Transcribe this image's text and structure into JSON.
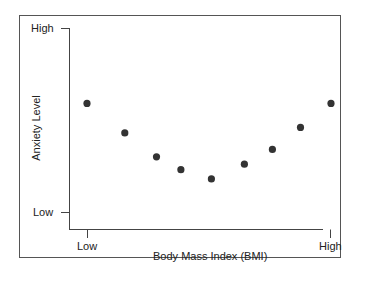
{
  "chart_data": {
    "type": "scatter",
    "title": "",
    "xlabel": "Body Mass Index (BMI)",
    "ylabel": "Anxiety Level",
    "x_tick_labels": [
      "Low",
      "High"
    ],
    "y_tick_labels": [
      "Low",
      "High"
    ],
    "xlim": [
      0,
      10
    ],
    "ylim": [
      0,
      10
    ],
    "grid": false,
    "legend": null,
    "x": [
      0,
      1.55,
      2.85,
      3.85,
      5.1,
      6.45,
      7.6,
      8.75,
      10
    ],
    "y": [
      5.9,
      4.3,
      3.0,
      2.3,
      1.8,
      2.6,
      3.4,
      4.6,
      5.9
    ],
    "color": "#333333"
  },
  "labels": {
    "y_high": "High",
    "y_low": "Low",
    "x_low": "Low",
    "x_high": "High",
    "xlabel": "Body Mass Index (BMI)",
    "ylabel": "Anxiety Level"
  }
}
